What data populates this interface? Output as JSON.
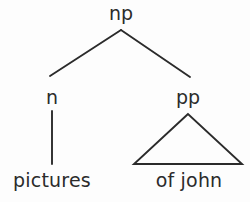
{
  "diagram": {
    "type": "syntax-tree",
    "title": "",
    "background_color": "#fdfdfd",
    "stroke_color": "#2b2b2b",
    "text_color": "#2b2b2b",
    "nodes": {
      "root": {
        "label": "np",
        "x": 121,
        "y": 22
      },
      "left_child": {
        "label": "n",
        "x": 52,
        "y": 106
      },
      "right_child": {
        "label": "pp",
        "x": 188,
        "y": 106
      },
      "left_terminal": {
        "label": "pictures",
        "x": 52,
        "y": 188
      },
      "right_terminal": {
        "label": "of john",
        "x": 189,
        "y": 188
      }
    },
    "edges": [
      {
        "name": "np-to-n",
        "from": "np",
        "to": "n",
        "kind": "line"
      },
      {
        "name": "np-to-pp",
        "from": "np",
        "to": "pp",
        "kind": "line"
      },
      {
        "name": "n-to-pictures",
        "from": "n",
        "to": "pictures",
        "kind": "line"
      },
      {
        "name": "pp-to-of-john",
        "from": "pp",
        "to": "of john",
        "kind": "triangle"
      }
    ]
  }
}
